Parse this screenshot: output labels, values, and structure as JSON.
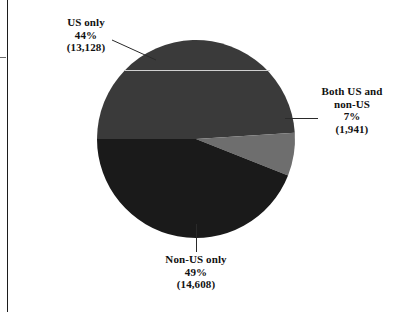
{
  "chart_data": {
    "type": "pie",
    "title": "",
    "subtitle": "",
    "xlabel": "",
    "ylabel": "",
    "legend_position": "none",
    "grid": false,
    "total": 29677,
    "categories": [
      "US only",
      "Both US and non-US",
      "Non-US only"
    ],
    "values": [
      13128,
      1941,
      14608
    ],
    "percentages": [
      44,
      7,
      49
    ],
    "slices": [
      {
        "label": "US only",
        "percent_text": "44%",
        "count_text": "(13,128)",
        "percent": 44,
        "value": 13128,
        "color": "#1a1a1a"
      },
      {
        "label_line1": "Both US and",
        "label_line2": "non-US",
        "percent_text": "7%",
        "count_text": "(1,941)",
        "percent": 7,
        "value": 1941,
        "color": "#6e6e6e"
      },
      {
        "label": "Non-US only",
        "percent_text": "49%",
        "count_text": "(14,608)",
        "percent": 49,
        "value": 14608,
        "color": "#3a3a3a"
      }
    ]
  },
  "callouts": {
    "us_only": {
      "label": "US only",
      "percent": "44%",
      "count": "(13,128)"
    },
    "both": {
      "label_line1": "Both US and",
      "label_line2": "non-US",
      "percent": "7%",
      "count": "(1,941)"
    },
    "non_us_only": {
      "label": "Non-US only",
      "percent": "49%",
      "count": "(14,608)"
    }
  },
  "colors": {
    "us_only": "#1a1a1a",
    "both_us_non_us": "#6e6e6e",
    "non_us_only": "#3a3a3a",
    "background": "#ffffff",
    "rule": "#1c1c1c",
    "leader": "#2a2a2a"
  }
}
